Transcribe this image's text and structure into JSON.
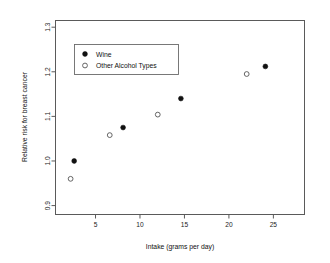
{
  "chart_data": {
    "type": "scatter",
    "title": "",
    "xlabel": "Intake (grams per day)",
    "ylabel": "Relative risk for breast cancer",
    "xlim": [
      0.5,
      28.5
    ],
    "ylim": [
      0.88,
      1.315
    ],
    "xticks": [
      5,
      10,
      15,
      20,
      25
    ],
    "yticks": [
      0.9,
      1.0,
      1.1,
      1.2,
      1.3
    ],
    "xtick_labels": [
      "5",
      "10",
      "15",
      "20",
      "25"
    ],
    "ytick_labels": [
      "0.9",
      "1.0",
      "1.1",
      "1.2",
      "1.3"
    ],
    "grid": false,
    "legend_position": "upper left",
    "series": [
      {
        "name": "Wine",
        "marker": "filled-circle",
        "color": "#111111",
        "points": [
          {
            "x": 2.6,
            "y": 1.0
          },
          {
            "x": 8.1,
            "y": 1.075
          },
          {
            "x": 14.6,
            "y": 1.14
          },
          {
            "x": 24.1,
            "y": 1.212
          }
        ]
      },
      {
        "name": "Other Alcohol Types",
        "marker": "open-circle",
        "color": "#555555",
        "points": [
          {
            "x": 2.2,
            "y": 0.96
          },
          {
            "x": 6.6,
            "y": 1.058
          },
          {
            "x": 12.0,
            "y": 1.104
          },
          {
            "x": 22.0,
            "y": 1.195
          }
        ]
      }
    ]
  },
  "legend": {
    "entries": [
      {
        "label": "Wine",
        "marker": "filled-circle"
      },
      {
        "label": "Other Alcohol Types",
        "marker": "open-circle"
      }
    ]
  },
  "axes": {
    "x_title": "Intake (grams per day)",
    "y_title": "Relative risk for breast cancer"
  }
}
